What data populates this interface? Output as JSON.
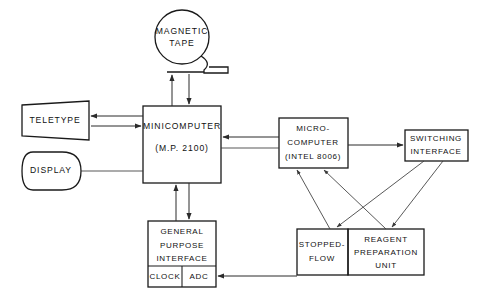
{
  "diagram": {
    "stroke_color": "#1a1a1a",
    "background_color": "#ffffff",
    "nodes": {
      "magnetic_tape": {
        "line1": "MAGNETIC",
        "line2": "TAPE",
        "shape": "circle-tape-reel"
      },
      "teletype": {
        "line1": "TELETYPE",
        "shape": "trapezoid"
      },
      "display": {
        "line1": "DISPLAY",
        "shape": "stadium"
      },
      "minicomputer": {
        "line1": "MINICOMPUTER",
        "line2": "(M.P. 2100)",
        "shape": "rectangle"
      },
      "microcomputer": {
        "line1": "MICRO-",
        "line2": "COMPUTER",
        "line3": "(INTEL 8006)",
        "shape": "rectangle"
      },
      "switching_interface": {
        "line1": "SWITCHING",
        "line2": "INTERFACE",
        "shape": "rectangle"
      },
      "general_purpose_interface": {
        "line1": "GENERAL",
        "line2": "PURPOSE",
        "line3": "INTERFACE",
        "sub_left": "CLOCK",
        "sub_right": "ADC",
        "shape": "rectangle-divided"
      },
      "stopped_flow": {
        "line1": "STOPPED-",
        "line2": "FLOW",
        "shape": "rectangle"
      },
      "reagent_preparation_unit": {
        "line1": "REAGENT",
        "line2": "PREPARATION",
        "line3": "UNIT",
        "shape": "rectangle"
      }
    },
    "connections": [
      {
        "from": "magnetic-tape",
        "to": "minicomputer",
        "arrow": "down"
      },
      {
        "from": "minicomputer",
        "to": "magnetic-tape",
        "arrow": "up"
      },
      {
        "from": "minicomputer",
        "to": "teletype",
        "arrow": "left"
      },
      {
        "from": "teletype",
        "to": "minicomputer",
        "arrow": "right"
      },
      {
        "from": "display",
        "to": "minicomputer",
        "arrow": "none"
      },
      {
        "from": "microcomputer",
        "to": "minicomputer",
        "arrow": "left"
      },
      {
        "from": "minicomputer",
        "to": "microcomputer",
        "arrow": "none"
      },
      {
        "from": "microcomputer",
        "to": "switching-interface",
        "arrow": "right"
      },
      {
        "from": "minicomputer",
        "to": "general-purpose-interface",
        "arrow": "down"
      },
      {
        "from": "general-purpose-interface",
        "to": "minicomputer",
        "arrow": "up"
      },
      {
        "from": "stopped-flow",
        "to": "microcomputer",
        "arrow": "up"
      },
      {
        "from": "reagent-preparation-unit",
        "to": "microcomputer",
        "arrow": "up"
      },
      {
        "from": "switching-interface",
        "to": "stopped-flow",
        "arrow": "down"
      },
      {
        "from": "switching-interface",
        "to": "reagent-preparation-unit",
        "arrow": "down"
      },
      {
        "from": "stopped-flow",
        "to": "adc",
        "arrow": "left"
      }
    ]
  }
}
